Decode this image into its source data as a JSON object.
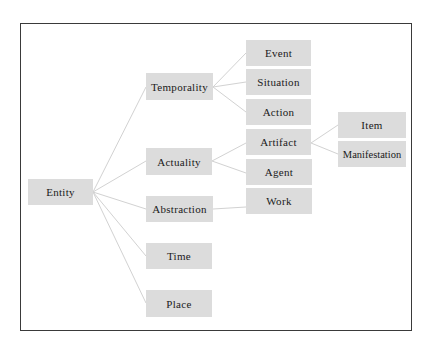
{
  "diagram": {
    "type": "tree",
    "colors": {
      "node_fill": "#dcdcdc",
      "link": "#d2d2d2",
      "frame_border": "#3a3a3a",
      "text": "#1a1a1a"
    },
    "nodes": {
      "entity": "Entity",
      "temporality": "Temporality",
      "actuality": "Actuality",
      "abstraction": "Abstraction",
      "time": "Time",
      "place": "Place",
      "event": "Event",
      "situation": "Situation",
      "action": "Action",
      "artifact": "Artifact",
      "agent": "Agent",
      "work": "Work",
      "item": "Item",
      "manifestation": "Manifestation"
    },
    "edges": [
      [
        "Entity",
        "Temporality"
      ],
      [
        "Entity",
        "Actuality"
      ],
      [
        "Entity",
        "Abstraction"
      ],
      [
        "Entity",
        "Time"
      ],
      [
        "Entity",
        "Place"
      ],
      [
        "Temporality",
        "Event"
      ],
      [
        "Temporality",
        "Situation"
      ],
      [
        "Temporality",
        "Action"
      ],
      [
        "Actuality",
        "Artifact"
      ],
      [
        "Actuality",
        "Agent"
      ],
      [
        "Abstraction",
        "Work"
      ],
      [
        "Artifact",
        "Item"
      ],
      [
        "Artifact",
        "Manifestation"
      ]
    ]
  }
}
